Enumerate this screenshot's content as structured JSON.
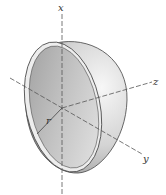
{
  "figure": {
    "labels": {
      "x_axis": "x",
      "y_axis": "y",
      "z_axis": "z",
      "radius": "r"
    },
    "colors": {
      "shell_light": "#f2f2f2",
      "shell_mid": "#c8c8c8",
      "shell_dark": "#8c8c8c",
      "outline": "#444444",
      "axis": "#555555"
    }
  }
}
